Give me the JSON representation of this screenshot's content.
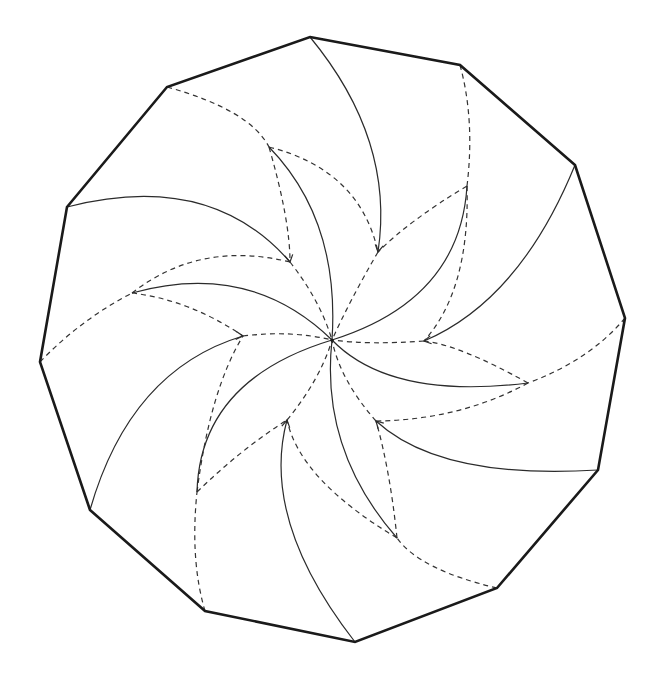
{
  "diagram": {
    "type": "crease-pattern",
    "colors": {
      "background": "#ffffff",
      "outline": "#1a1a1a",
      "solid_crease": "#2b2b2b",
      "dashed_crease": "#333333"
    },
    "center": [
      332,
      340
    ],
    "outline_vertices": [
      [
        310,
        37
      ],
      [
        460,
        65
      ],
      [
        575,
        165
      ],
      [
        625,
        318
      ],
      [
        598,
        470
      ],
      [
        497,
        588
      ],
      [
        355,
        642
      ],
      [
        205,
        611
      ],
      [
        90,
        510
      ],
      [
        40,
        362
      ],
      [
        67,
        207
      ],
      [
        167,
        87
      ]
    ],
    "solid_curves": [
      "M310,37 Q395,140 378,252",
      "M575,165 Q520,300 424,341",
      "M598,470 Q440,480 376,421",
      "M355,642 Q260,520 287,420",
      "M90,510 Q130,370 243,336",
      "M67,207 Q210,170 290,262",
      "M269,147 Q340,220 332,340",
      "M467,186 Q460,300 332,340",
      "M528,383 Q390,400 332,340",
      "M397,538 Q320,450 332,340",
      "M197,492 Q200,380 332,340",
      "M132,293 Q250,260 332,340"
    ],
    "dashed_curves": [
      "M167,87 Q250,110 269,147",
      "M269,147 Q290,220 290,262",
      "M269,147 Q360,170 378,252",
      "M460,65 Q475,120 467,186",
      "M467,186 Q410,220 378,252",
      "M467,186 Q470,290 424,341",
      "M625,318 Q590,360 528,383",
      "M528,383 Q460,345 424,341",
      "M528,383 Q460,420 376,421",
      "M497,588 Q420,570 397,538",
      "M397,538 Q390,470 376,421",
      "M397,538 Q300,480 287,420",
      "M205,611 Q190,560 197,492",
      "M197,492 Q240,450 287,420",
      "M197,492 Q210,390 243,336",
      "M40,362 Q80,320 132,293",
      "M132,293 Q190,300 243,336",
      "M132,293 Q200,240 290,262",
      "M290,262 Q320,300 332,340",
      "M378,252 Q350,300 332,340",
      "M424,341 Q370,345 332,340",
      "M376,421 Q340,380 332,340",
      "M287,420 Q320,380 332,340",
      "M243,336 Q290,330 332,340"
    ],
    "arrowheads": [
      [
        290,
        262,
        80
      ],
      [
        378,
        252,
        100
      ],
      [
        424,
        341,
        170
      ],
      [
        376,
        421,
        225
      ],
      [
        287,
        420,
        280
      ],
      [
        243,
        336,
        5
      ]
    ]
  }
}
